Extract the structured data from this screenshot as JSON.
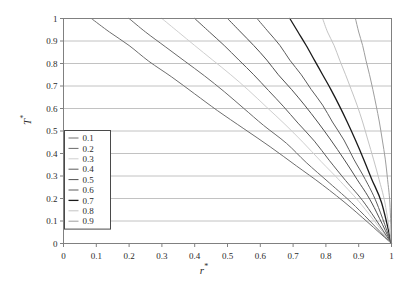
{
  "figure": {
    "background": "#ffffff",
    "width": 408,
    "height": 287
  },
  "axis_titles": {
    "x": "r",
    "x_star": "*",
    "y": "T",
    "y_star": "*"
  },
  "chart_data": {
    "type": "line",
    "title": "",
    "xlabel": "r*",
    "ylabel": "T*",
    "xlim": [
      0,
      1
    ],
    "ylim": [
      0,
      1
    ],
    "grid": "horizontal",
    "grid_color": "#b3b3b3",
    "frame_color": "#808080",
    "legend_position": "left-middle",
    "legend_title": "",
    "xticks": [
      "0",
      "0.1",
      "0.2",
      "0.3",
      "0.4",
      "0.5",
      "0.6",
      "0.7",
      "0.8",
      "0.9",
      "1"
    ],
    "xtick_values": [
      0,
      0.1,
      0.2,
      0.3,
      0.4,
      0.5,
      0.6,
      0.7,
      0.8,
      0.9,
      1
    ],
    "yticks": [
      "0",
      "0.1",
      "0.2",
      "0.3",
      "0.4",
      "0.5",
      "0.6",
      "0.7",
      "0.8",
      "0.9",
      "1"
    ],
    "ytick_values": [
      0,
      0.1,
      0.2,
      0.3,
      0.4,
      0.5,
      0.6,
      0.7,
      0.8,
      0.9,
      1
    ],
    "common_endpoint": [
      1,
      0
    ],
    "series": [
      {
        "name": "0.1",
        "color": "#6e6e6e",
        "width": 1.0,
        "x": [
          0.085,
          0.14,
          0.2,
          0.26,
          0.33,
          0.4,
          0.47,
          0.55,
          0.63,
          0.71,
          0.79,
          0.88,
          1.0
        ],
        "y": [
          1.0,
          0.94,
          0.88,
          0.81,
          0.74,
          0.665,
          0.59,
          0.51,
          0.43,
          0.345,
          0.26,
          0.155,
          0.0
        ]
      },
      {
        "name": "0.2",
        "color": "#6a6a6a",
        "width": 1.0,
        "x": [
          0.2,
          0.25,
          0.31,
          0.37,
          0.43,
          0.49,
          0.55,
          0.61,
          0.68,
          0.74,
          0.81,
          0.89,
          1.0
        ],
        "y": [
          1.0,
          0.94,
          0.875,
          0.81,
          0.745,
          0.675,
          0.6,
          0.525,
          0.445,
          0.36,
          0.27,
          0.165,
          0.0
        ]
      },
      {
        "name": "0.3",
        "color": "#cfcfcf",
        "width": 1.0,
        "x": [
          0.3,
          0.35,
          0.4,
          0.455,
          0.51,
          0.565,
          0.62,
          0.675,
          0.73,
          0.785,
          0.845,
          0.91,
          1.0
        ],
        "y": [
          1.0,
          0.94,
          0.88,
          0.815,
          0.75,
          0.68,
          0.605,
          0.53,
          0.45,
          0.365,
          0.275,
          0.17,
          0.0
        ]
      },
      {
        "name": "0.4",
        "color": "#5a5a5a",
        "width": 1.0,
        "x": [
          0.4,
          0.445,
          0.49,
          0.535,
          0.58,
          0.625,
          0.67,
          0.715,
          0.765,
          0.81,
          0.86,
          0.92,
          1.0
        ],
        "y": [
          1.0,
          0.94,
          0.88,
          0.815,
          0.75,
          0.68,
          0.61,
          0.535,
          0.455,
          0.37,
          0.28,
          0.175,
          0.0
        ]
      },
      {
        "name": "0.5",
        "color": "#4f4f4f",
        "width": 1.0,
        "x": [
          0.5,
          0.54,
          0.58,
          0.62,
          0.655,
          0.695,
          0.735,
          0.775,
          0.815,
          0.855,
          0.895,
          0.94,
          1.0
        ],
        "y": [
          1.0,
          0.94,
          0.88,
          0.815,
          0.75,
          0.685,
          0.615,
          0.54,
          0.46,
          0.375,
          0.285,
          0.18,
          0.0
        ]
      },
      {
        "name": "0.6",
        "color": "#5c5c5c",
        "width": 1.0,
        "x": [
          0.59,
          0.625,
          0.66,
          0.69,
          0.725,
          0.755,
          0.79,
          0.82,
          0.855,
          0.885,
          0.92,
          0.955,
          1.0
        ],
        "y": [
          1.0,
          0.94,
          0.88,
          0.815,
          0.75,
          0.685,
          0.615,
          0.54,
          0.46,
          0.375,
          0.285,
          0.18,
          0.0
        ]
      },
      {
        "name": "0.7",
        "color": "#1a1a1a",
        "width": 1.3,
        "x": [
          0.69,
          0.715,
          0.74,
          0.765,
          0.79,
          0.815,
          0.84,
          0.865,
          0.89,
          0.915,
          0.94,
          0.97,
          1.0
        ],
        "y": [
          1.0,
          0.94,
          0.88,
          0.815,
          0.75,
          0.685,
          0.615,
          0.54,
          0.46,
          0.375,
          0.285,
          0.18,
          0.0
        ]
      },
      {
        "name": "0.8",
        "color": "#c4c4c4",
        "width": 1.0,
        "x": [
          0.79,
          0.805,
          0.825,
          0.842,
          0.86,
          0.877,
          0.895,
          0.912,
          0.928,
          0.945,
          0.962,
          0.98,
          1.0
        ],
        "y": [
          1.0,
          0.94,
          0.88,
          0.815,
          0.75,
          0.685,
          0.615,
          0.54,
          0.46,
          0.375,
          0.285,
          0.18,
          0.0
        ]
      },
      {
        "name": "0.9",
        "color": "#9e9e9e",
        "width": 1.0,
        "x": [
          0.89,
          0.9,
          0.912,
          0.922,
          0.933,
          0.943,
          0.953,
          0.963,
          0.972,
          0.981,
          0.988,
          0.995,
          1.0
        ],
        "y": [
          1.0,
          0.94,
          0.88,
          0.815,
          0.75,
          0.685,
          0.615,
          0.54,
          0.46,
          0.375,
          0.285,
          0.18,
          0.0
        ]
      }
    ],
    "legend_entries": [
      {
        "label": "0.1",
        "color": "#6e6e6e",
        "width": 1.0
      },
      {
        "label": "0.2",
        "color": "#6a6a6a",
        "width": 1.0
      },
      {
        "label": "0.3",
        "color": "#cfcfcf",
        "width": 1.0
      },
      {
        "label": "0.4",
        "color": "#5a5a5a",
        "width": 1.0
      },
      {
        "label": "0.5",
        "color": "#4f4f4f",
        "width": 1.0
      },
      {
        "label": "0.6",
        "color": "#5c5c5c",
        "width": 1.0
      },
      {
        "label": "0.7",
        "color": "#1a1a1a",
        "width": 1.3
      },
      {
        "label": "0.8",
        "color": "#c4c4c4",
        "width": 1.0
      },
      {
        "label": "0.9",
        "color": "#9e9e9e",
        "width": 1.0
      }
    ]
  }
}
